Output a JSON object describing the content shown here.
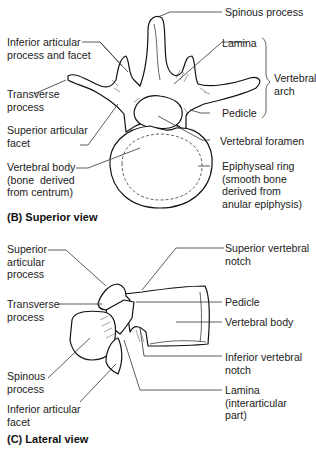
{
  "superior_view": {
    "caption": "(B) Superior view",
    "labels": {
      "spinous_process": "Spinous process",
      "inferior_articular": "Inferior articular\nprocess and facet",
      "lamina": "Lamina",
      "vertebral_arch": "Vertebral\narch",
      "transverse_process": "Transverse\nprocess",
      "superior_articular_facet": "Superior articular\nfacet",
      "pedicle": "Pedicle",
      "vertebral_foramen": "Vertebral foramen",
      "vertebral_body": "Vertebral body\n(bone  derived\nfrom centrum)",
      "epiphyseal_ring": "Epiphyseal ring\n(smooth bone\nderived from\nanular epiphysis)"
    }
  },
  "lateral_view": {
    "caption": "(C) Lateral view",
    "labels": {
      "superior_articular_process": "Superior\narticular\nprocess",
      "superior_vertebral_notch": "Superior vertebral\nnotch",
      "transverse_process": "Transverse\nprocess",
      "pedicle": "Pedicle",
      "vertebral_body": "Vertebral body",
      "spinous_process": "Spinous\nprocess",
      "inferior_vertebral_notch": "Inferior vertebral\nnotch",
      "inferior_articular_facet": "Inferior articular\nfacet",
      "lamina": "Lamina\n(interarticular\npart)"
    }
  }
}
